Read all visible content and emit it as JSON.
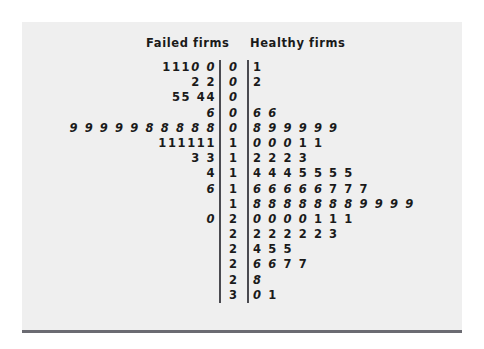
{
  "figure": {
    "background_color": "#efefef",
    "rule_color": "#6b6b72",
    "text_color": "#1a1a1a",
    "header_failed": "Failed firms",
    "header_healthy": "Healthy firms"
  },
  "chart_data": {
    "type": "table",
    "title": "",
    "subtitle": "",
    "xlabel": "",
    "ylabel": "",
    "chart_kind": "back-to-back stem-and-leaf plot",
    "legend": [
      "Failed firms",
      "Healthy firms"
    ],
    "stems": [
      "0",
      "0",
      "0",
      "0",
      "0",
      "1",
      "1",
      "1",
      "1",
      "1",
      "2",
      "2",
      "2",
      "2",
      "2",
      "3"
    ],
    "rows": [
      {
        "stem": "0",
        "left": "1110 0",
        "right": "1"
      },
      {
        "stem": "0",
        "left": "2 2",
        "right": "2"
      },
      {
        "stem": "0",
        "left": "55 44",
        "right": ""
      },
      {
        "stem": "0",
        "left": "6",
        "right": "6 6"
      },
      {
        "stem": "0",
        "left": "9 9 9 9 9 8 8 8 8 8",
        "right": "8 9 9 9 9 9"
      },
      {
        "stem": "1",
        "left": "111111",
        "right": "0 0 0 1 1"
      },
      {
        "stem": "1",
        "left": "3 3",
        "right": "2 2 2 3"
      },
      {
        "stem": "1",
        "left": "4",
        "right": "4 4 4 5 5 5 5"
      },
      {
        "stem": "1",
        "left": "6",
        "right": "6 6 6 6 6 7 7 7"
      },
      {
        "stem": "1",
        "left": "",
        "right": "8 8 8 8 8 8 8 9 9 9 9"
      },
      {
        "stem": "2",
        "left": "0",
        "right": "0 0 0 0 1 1 1"
      },
      {
        "stem": "2",
        "left": "",
        "right": "2 2 2 2 2 3"
      },
      {
        "stem": "2",
        "left": "",
        "right": "4 5 5"
      },
      {
        "stem": "2",
        "left": "",
        "right": "6 6 7 7"
      },
      {
        "stem": "2",
        "left": "",
        "right": "8"
      },
      {
        "stem": "3",
        "left": "",
        "right": "0 1"
      }
    ],
    "failed_firms_values": [
      0.1,
      0.11,
      0.11,
      0.11,
      0.12,
      0.12,
      0.14,
      0.14,
      0.15,
      0.15,
      0.16,
      0.18,
      0.18,
      0.18,
      0.18,
      0.18,
      0.19,
      0.19,
      0.19,
      0.19,
      0.19,
      0.21,
      0.21,
      0.21,
      0.21,
      0.21,
      0.21,
      0.23,
      0.23,
      0.24,
      0.26,
      0.3
    ],
    "healthy_firms_values": [
      0.01,
      0.02,
      0.06,
      0.06,
      0.08,
      0.09,
      0.09,
      0.09,
      0.09,
      0.09,
      0.1,
      0.1,
      0.1,
      0.11,
      0.11,
      0.12,
      0.12,
      0.12,
      0.13,
      0.14,
      0.14,
      0.14,
      0.15,
      0.15,
      0.15,
      0.15,
      0.16,
      0.16,
      0.16,
      0.16,
      0.16,
      0.17,
      0.17,
      0.17,
      0.18,
      0.18,
      0.18,
      0.18,
      0.18,
      0.18,
      0.18,
      0.19,
      0.19,
      0.19,
      0.19,
      0.2,
      0.2,
      0.2,
      0.2,
      0.21,
      0.21,
      0.21,
      0.22,
      0.22,
      0.22,
      0.22,
      0.22,
      0.23,
      0.24,
      0.25,
      0.25,
      0.26,
      0.26,
      0.27,
      0.27,
      0.28,
      0.3,
      0.31
    ],
    "grid": false,
    "legend_position": "top"
  }
}
